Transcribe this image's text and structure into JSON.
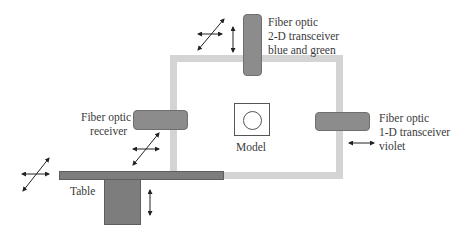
{
  "diagram": {
    "colors": {
      "frame": "#d4d4d4",
      "sensor": "#8c8c8c",
      "table": "#7d7d7d",
      "arrow": "#222222"
    },
    "labels": {
      "top_sensor": [
        "Fiber optic",
        "2-D transceiver",
        "blue and green"
      ],
      "left_sensor": [
        "Fiber optic",
        "receiver"
      ],
      "right_sensor": [
        "Fiber optic",
        "1-D transceiver",
        "violet"
      ],
      "model": "Model",
      "table": "Table"
    },
    "motion_indicators": [
      {
        "near": "top_sensor",
        "type": "2-D (horizontal + diagonal)"
      },
      {
        "near": "top_sensor",
        "type": "vertical"
      },
      {
        "near": "left_sensor",
        "type": "2-D (horizontal + diagonal)"
      },
      {
        "near": "right_sensor",
        "type": "horizontal"
      },
      {
        "near": "table",
        "type": "2-D (horizontal + diagonal)"
      },
      {
        "near": "table_leg",
        "type": "vertical"
      }
    ]
  }
}
